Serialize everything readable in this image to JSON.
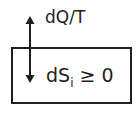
{
  "diagram": {
    "flow_label": "dQ/T",
    "system": {
      "entropy_symbol": "dS",
      "entropy_subscript": "i",
      "relation": " ≥ 0"
    },
    "arrow": "bidirectional-vertical"
  }
}
